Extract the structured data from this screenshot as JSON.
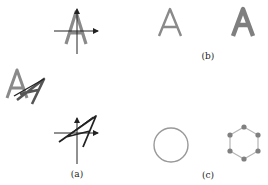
{
  "figure": {
    "panels": [
      {
        "id": "a",
        "caption": "(a)",
        "description": "Letter A under transformations with coordinate axes",
        "elements": [
          {
            "type": "axes-with-glyph",
            "glyph": "A",
            "style": "upright gray"
          },
          {
            "type": "glyph",
            "glyph": "A",
            "style": "sheared gray/black overlay"
          },
          {
            "type": "axes-with-glyph",
            "glyph": "A",
            "style": "sheared black italic"
          }
        ]
      },
      {
        "id": "b",
        "caption": "(b)",
        "description": "Thin and bold letter A",
        "glyphs": [
          "A",
          "A"
        ]
      },
      {
        "id": "c",
        "caption": "(c)",
        "description": "Circle and hexagon with vertex nodes",
        "shapes": [
          "circle",
          "hexagon"
        ],
        "hexagon_nodes": 6
      }
    ],
    "colors": {
      "gray_glyph": "#8a8a8a",
      "dark": "#222222",
      "circle_stroke": "#999999",
      "hex_edge": "#b5b5b5",
      "hex_node": "#808080"
    }
  }
}
